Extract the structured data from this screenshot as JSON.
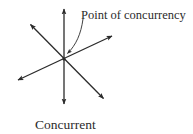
{
  "diagram": {
    "callout_label": "Point of concurrency",
    "caption": "Concurrent",
    "colors": {
      "line": "#2b2b2b",
      "text": "#2b2b2b",
      "background": "#ffffff"
    },
    "intersection": {
      "x": 64,
      "y": 59
    },
    "lines": [
      {
        "name": "vertical-line",
        "x1": 64,
        "y1": 7,
        "x2": 64,
        "y2": 106
      },
      {
        "name": "diagonal-line-nw-se",
        "x1": 29,
        "y1": 23,
        "x2": 105,
        "y2": 100
      },
      {
        "name": "diagonal-line-sw-ne",
        "x1": 16,
        "y1": 81,
        "x2": 114,
        "y2": 35
      }
    ]
  }
}
